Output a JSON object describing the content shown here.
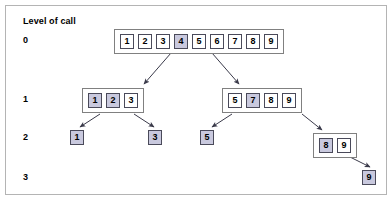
{
  "figure": {
    "caption": "Level of call",
    "width": 392,
    "height": 200,
    "colors": {
      "highlight": "#c9c9de",
      "cell_border": "#4a4a5a",
      "node_border": "#808080",
      "frame_border": "#b4b4b4",
      "arrow": "#3a3a4a",
      "background": "#ffffff",
      "text": "#000000"
    }
  },
  "levels": [
    {
      "label": "0",
      "y": 40
    },
    {
      "label": "1",
      "y": 99
    },
    {
      "label": "2",
      "y": 137
    },
    {
      "label": "3",
      "y": 177
    }
  ],
  "nodes": [
    {
      "id": "root",
      "level": 0,
      "boxed": true,
      "x": 114,
      "y": 29,
      "cells": [
        {
          "value": "1",
          "highlighted": false
        },
        {
          "value": "2",
          "highlighted": false
        },
        {
          "value": "3",
          "highlighted": false
        },
        {
          "value": "4",
          "highlighted": true
        },
        {
          "value": "5",
          "highlighted": false
        },
        {
          "value": "6",
          "highlighted": false
        },
        {
          "value": "7",
          "highlighted": false
        },
        {
          "value": "8",
          "highlighted": false
        },
        {
          "value": "9",
          "highlighted": false
        }
      ]
    },
    {
      "id": "l1-left",
      "level": 1,
      "boxed": true,
      "x": 82,
      "y": 88,
      "cells": [
        {
          "value": "1",
          "highlighted": true
        },
        {
          "value": "2",
          "highlighted": true
        },
        {
          "value": "3",
          "highlighted": false
        }
      ]
    },
    {
      "id": "l1-right",
      "level": 1,
      "boxed": true,
      "x": 222,
      "y": 88,
      "cells": [
        {
          "value": "5",
          "highlighted": false
        },
        {
          "value": "7",
          "highlighted": true
        },
        {
          "value": "8",
          "highlighted": false
        },
        {
          "value": "9",
          "highlighted": false
        }
      ]
    },
    {
      "id": "l2-a",
      "level": 2,
      "boxed": false,
      "x": 70,
      "y": 130,
      "cells": [
        {
          "value": "1",
          "highlighted": true
        }
      ]
    },
    {
      "id": "l2-b",
      "level": 2,
      "boxed": false,
      "x": 148,
      "y": 130,
      "cells": [
        {
          "value": "3",
          "highlighted": true
        }
      ]
    },
    {
      "id": "l2-c",
      "level": 2,
      "boxed": false,
      "x": 200,
      "y": 130,
      "cells": [
        {
          "value": "5",
          "highlighted": true
        }
      ]
    },
    {
      "id": "l2-d",
      "level": 2,
      "boxed": true,
      "x": 313,
      "y": 133,
      "cells": [
        {
          "value": "8",
          "highlighted": true
        },
        {
          "value": "9",
          "highlighted": false
        }
      ]
    },
    {
      "id": "l3-a",
      "level": 3,
      "boxed": false,
      "x": 362,
      "y": 170,
      "cells": [
        {
          "value": "9",
          "highlighted": true
        }
      ]
    }
  ],
  "arrows": [
    {
      "name": "root-to-l1-left",
      "x1": 171,
      "y1": 53,
      "x2": 144,
      "y2": 84
    },
    {
      "name": "root-to-l1-right",
      "x1": 212,
      "y1": 53,
      "x2": 239,
      "y2": 84
    },
    {
      "name": "l1left-to-l2-a",
      "x1": 100,
      "y1": 114,
      "x2": 80,
      "y2": 127
    },
    {
      "name": "l1left-to-l2-b",
      "x1": 134,
      "y1": 114,
      "x2": 154,
      "y2": 127
    },
    {
      "name": "l1right-to-l2-c",
      "x1": 232,
      "y1": 114,
      "x2": 212,
      "y2": 127
    },
    {
      "name": "l1right-to-l2-d",
      "x1": 302,
      "y1": 114,
      "x2": 322,
      "y2": 130
    },
    {
      "name": "l2d-to-l3-a",
      "x1": 350,
      "y1": 157,
      "x2": 370,
      "y2": 167
    }
  ]
}
